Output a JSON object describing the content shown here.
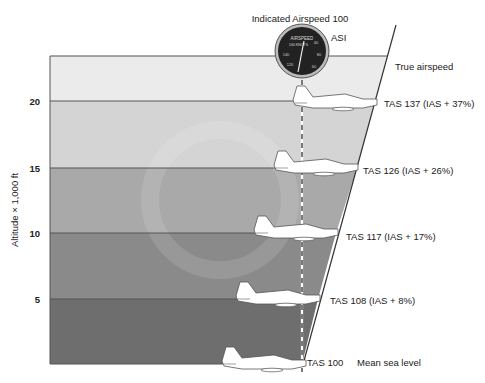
{
  "title": "Indicated Airspeed 100",
  "instrument": {
    "label": "ASI",
    "face_text": "AIRSPEED",
    "unit": "KNOTS",
    "face_numbers": [
      "160",
      "40",
      "140",
      "80",
      "120",
      "60"
    ]
  },
  "y_axis": {
    "label": "Altitude × 1,000 ft",
    "ticks": [
      "20",
      "15",
      "10",
      "5"
    ]
  },
  "line_labels": {
    "true_airspeed": "True airspeed",
    "mean_sea_level": "Mean sea level"
  },
  "bands": [
    {
      "altitude": "20+",
      "color": "#ebebeb"
    },
    {
      "altitude": "15-20",
      "color": "#d4d4d4"
    },
    {
      "altitude": "10-15",
      "color": "#a9a9a9"
    },
    {
      "altitude": "5-10",
      "color": "#8a8a8a"
    },
    {
      "altitude": "0-5",
      "color": "#6e6e6e"
    }
  ],
  "aircraft": [
    {
      "altitude": 20,
      "label": "TAS 137 (IAS + 37%)"
    },
    {
      "altitude": 15,
      "label": "TAS 126 (IAS + 26%)"
    },
    {
      "altitude": 10,
      "label": "TAS 117 (IAS + 17%)"
    },
    {
      "altitude": 5,
      "label": "TAS 108 (IAS + 8%)"
    },
    {
      "altitude": 0,
      "label": "TAS 100"
    }
  ]
}
